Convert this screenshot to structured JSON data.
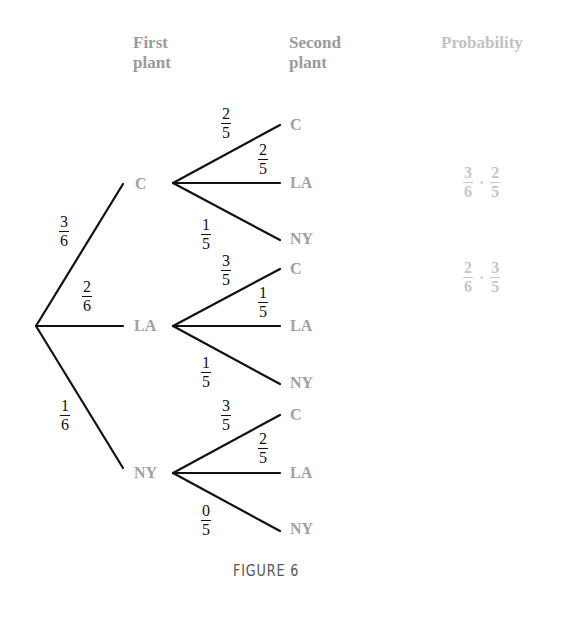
{
  "headers": {
    "first": [
      "First",
      "plant"
    ],
    "second": [
      "Second",
      "plant"
    ],
    "probability": "Probability"
  },
  "first_level": [
    {
      "label": "C",
      "prob": {
        "num": "3",
        "den": "6"
      }
    },
    {
      "label": "LA",
      "prob": {
        "num": "2",
        "den": "6"
      }
    },
    {
      "label": "NY",
      "prob": {
        "num": "1",
        "den": "6"
      }
    }
  ],
  "second_level": [
    {
      "parent": "C",
      "branches": [
        {
          "label": "C",
          "prob": {
            "num": "2",
            "den": "5"
          }
        },
        {
          "label": "LA",
          "prob": {
            "num": "2",
            "den": "5"
          }
        },
        {
          "label": "NY",
          "prob": {
            "num": "1",
            "den": "5"
          }
        }
      ]
    },
    {
      "parent": "LA",
      "branches": [
        {
          "label": "C",
          "prob": {
            "num": "3",
            "den": "5"
          }
        },
        {
          "label": "LA",
          "prob": {
            "num": "1",
            "den": "5"
          }
        },
        {
          "label": "NY",
          "prob": {
            "num": "1",
            "den": "5"
          }
        }
      ]
    },
    {
      "parent": "NY",
      "branches": [
        {
          "label": "C",
          "prob": {
            "num": "3",
            "den": "5"
          }
        },
        {
          "label": "LA",
          "prob": {
            "num": "2",
            "den": "5"
          }
        },
        {
          "label": "NY",
          "prob": {
            "num": "0",
            "den": "5"
          }
        }
      ]
    }
  ],
  "probabilities": [
    {
      "a": {
        "num": "3",
        "den": "6"
      },
      "op": "·",
      "b": {
        "num": "2",
        "den": "5"
      }
    },
    {
      "a": {
        "num": "2",
        "den": "6"
      },
      "op": "·",
      "b": {
        "num": "3",
        "den": "5"
      }
    }
  ],
  "caption": "FIGURE 6"
}
